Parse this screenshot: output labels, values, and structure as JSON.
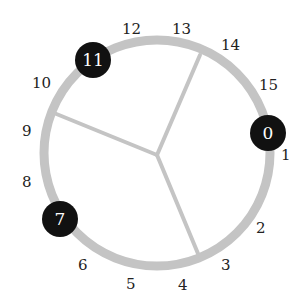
{
  "diagram": {
    "type": "ring-with-spokes",
    "colors": {
      "ring": "#c4c4c4",
      "spoke": "#c4c4c4",
      "node_fill": "#111111",
      "node_text": "#ffffff",
      "label": "#222222"
    },
    "ring_positions": [
      "0",
      "1",
      "2",
      "3",
      "4",
      "5",
      "6",
      "7",
      "8",
      "9",
      "10",
      "11",
      "12",
      "13",
      "14",
      "15"
    ],
    "highlighted_nodes": [
      {
        "label": "0"
      },
      {
        "label": "7"
      },
      {
        "label": "11"
      }
    ],
    "tick_labels": [
      {
        "label": "1"
      },
      {
        "label": "2"
      },
      {
        "label": "3"
      },
      {
        "label": "4"
      },
      {
        "label": "5"
      },
      {
        "label": "6"
      },
      {
        "label": "8"
      },
      {
        "label": "9"
      },
      {
        "label": "10"
      },
      {
        "label": "12"
      },
      {
        "label": "13"
      },
      {
        "label": "14"
      },
      {
        "label": "15"
      }
    ],
    "spokes": 3
  }
}
